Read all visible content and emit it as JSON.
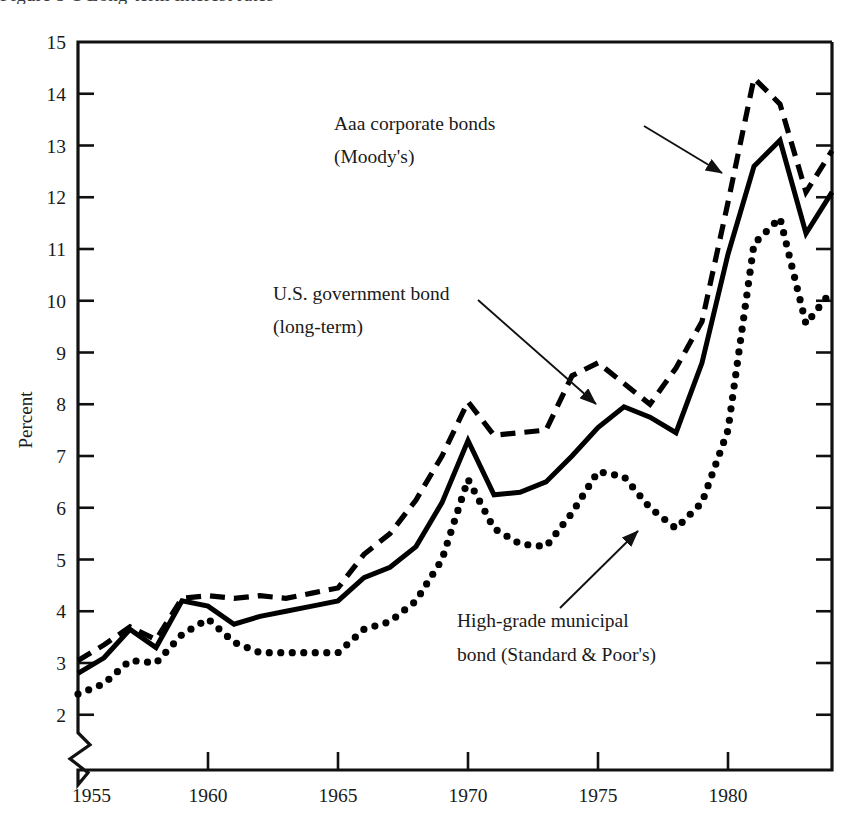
{
  "figure": {
    "title_fragment": "Figure 5-1  Long-term interest rates",
    "background_color": "#ffffff",
    "ink_color": "#000000"
  },
  "axes": {
    "y_label": "Percent",
    "y_ticks": [
      "2",
      "3",
      "4",
      "5",
      "6",
      "7",
      "8",
      "9",
      "10",
      "11",
      "12",
      "13",
      "14",
      "15"
    ],
    "y_min": 2,
    "y_max": 15,
    "y_axis_break": true,
    "x_ticks": [
      "1955",
      "1960",
      "1965",
      "1970",
      "1975",
      "1980"
    ],
    "x_min": 1955,
    "x_max": 1984,
    "grid": false
  },
  "annotations": [
    {
      "id": "aaa-corporate",
      "line1": "Aaa corporate bonds",
      "line2": "(Moody's)",
      "text_x": 334,
      "text_y1": 130,
      "text_y2": 163,
      "arrow_from_x": 644,
      "arrow_from_y": 126,
      "arrow_to_x": 722,
      "arrow_to_y": 173
    },
    {
      "id": "us-government",
      "line1": "U.S. government bond",
      "line2": "(long-term)",
      "text_x": 273,
      "text_y1": 300,
      "text_y2": 333,
      "arrow_from_x": 478,
      "arrow_from_y": 300,
      "arrow_to_x": 596,
      "arrow_to_y": 404
    },
    {
      "id": "municipal",
      "line1": "High-grade municipal",
      "line2": "bond (Standard & Poor's)",
      "text_x": 457,
      "text_y1": 627,
      "text_y2": 661,
      "arrow_from_x": 560,
      "arrow_from_y": 608,
      "arrow_to_x": 638,
      "arrow_to_y": 531
    }
  ],
  "chart_data": {
    "type": "line",
    "title": "Figure 5-1  Long-term interest rates",
    "xlabel": "",
    "ylabel": "Percent",
    "xlim": [
      1955,
      1984
    ],
    "ylim": [
      2,
      15
    ],
    "grid": false,
    "legend_position": "inline-annotations",
    "x": [
      1955,
      1956,
      1957,
      1958,
      1959,
      1960,
      1961,
      1962,
      1963,
      1964,
      1965,
      1966,
      1967,
      1968,
      1969,
      1970,
      1971,
      1972,
      1973,
      1974,
      1975,
      1976,
      1977,
      1978,
      1979,
      1980,
      1981,
      1982,
      1983,
      1984
    ],
    "series": [
      {
        "name": "Aaa corporate bonds (Moody's)",
        "style": "dashed",
        "values": [
          3.05,
          3.35,
          3.7,
          3.45,
          4.25,
          4.3,
          4.25,
          4.3,
          4.25,
          4.35,
          4.45,
          5.1,
          5.5,
          6.15,
          7.0,
          8.05,
          7.4,
          7.45,
          7.5,
          8.55,
          8.8,
          8.4,
          8.0,
          8.7,
          9.6,
          11.9,
          14.3,
          13.8,
          12.1,
          12.9
        ]
      },
      {
        "name": "U.S. government bond (long-term)",
        "style": "solid",
        "values": [
          2.8,
          3.1,
          3.65,
          3.3,
          4.2,
          4.1,
          3.75,
          3.9,
          4.0,
          4.1,
          4.2,
          4.65,
          4.85,
          5.25,
          6.1,
          7.3,
          6.25,
          6.3,
          6.5,
          7.0,
          7.55,
          7.95,
          7.75,
          7.45,
          8.8,
          10.9,
          12.6,
          13.1,
          11.3,
          12.1
        ]
      },
      {
        "name": "High-grade municipal bond (Standard & Poor's)",
        "style": "dotted",
        "values": [
          2.4,
          2.6,
          3.05,
          3.0,
          3.55,
          3.85,
          3.4,
          3.2,
          3.2,
          3.2,
          3.2,
          3.65,
          3.8,
          4.2,
          5.0,
          6.55,
          5.6,
          5.3,
          5.25,
          5.9,
          6.7,
          6.6,
          6.0,
          5.6,
          6.1,
          7.5,
          11.1,
          11.6,
          9.55,
          10.2
        ]
      }
    ]
  }
}
